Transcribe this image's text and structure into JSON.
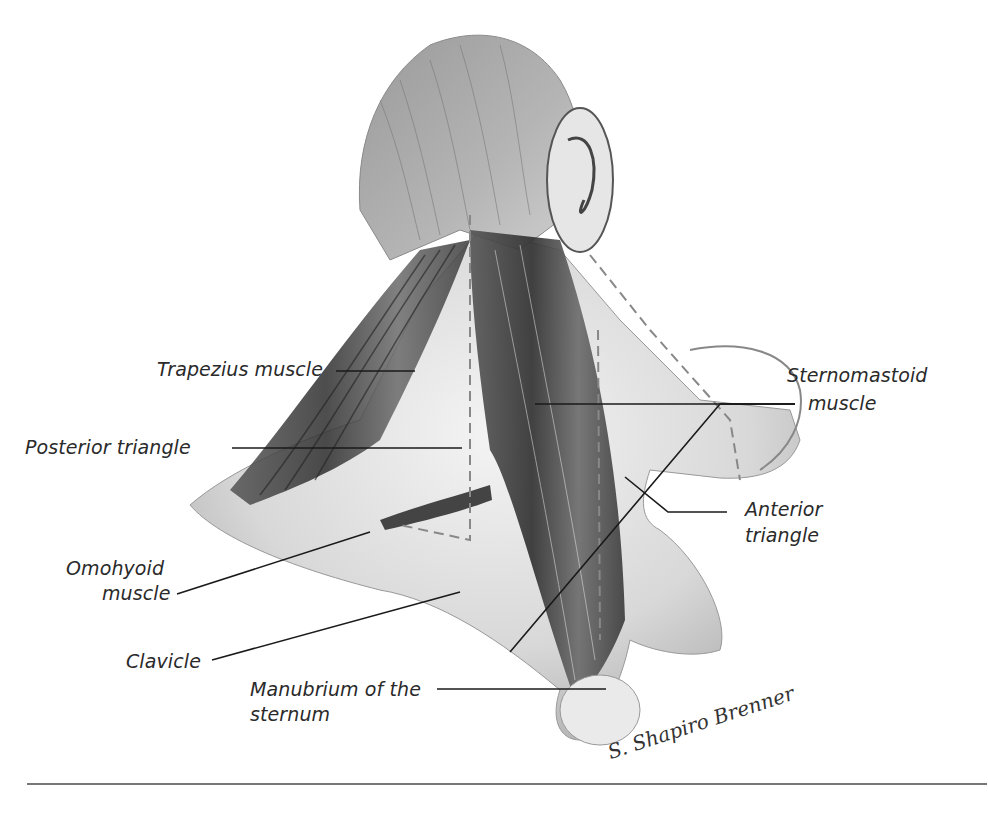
{
  "figure": {
    "labels": {
      "trapezius": "Trapezius muscle",
      "posterior_triangle": "Posterior triangle",
      "omohyoid_line1": "Omohyoid",
      "omohyoid_line2": "muscle",
      "clavicle": "Clavicle",
      "manubrium_line1": "Manubrium of the",
      "manubrium_line2": "sternum",
      "sternomastoid_line1": "Sternomastoid",
      "sternomastoid_line2": "muscle",
      "anterior_line1": "Anterior",
      "anterior_line2": "triangle"
    },
    "signature": "S. Shapiro Brenner",
    "colors": {
      "background": "#ffffff",
      "text": "#2a2a2a",
      "leader_line": "#1a1a1a",
      "muscle_dark": "#3a3a3a",
      "skin": "#d9d9d9",
      "dashed_outline": "#888888"
    }
  }
}
